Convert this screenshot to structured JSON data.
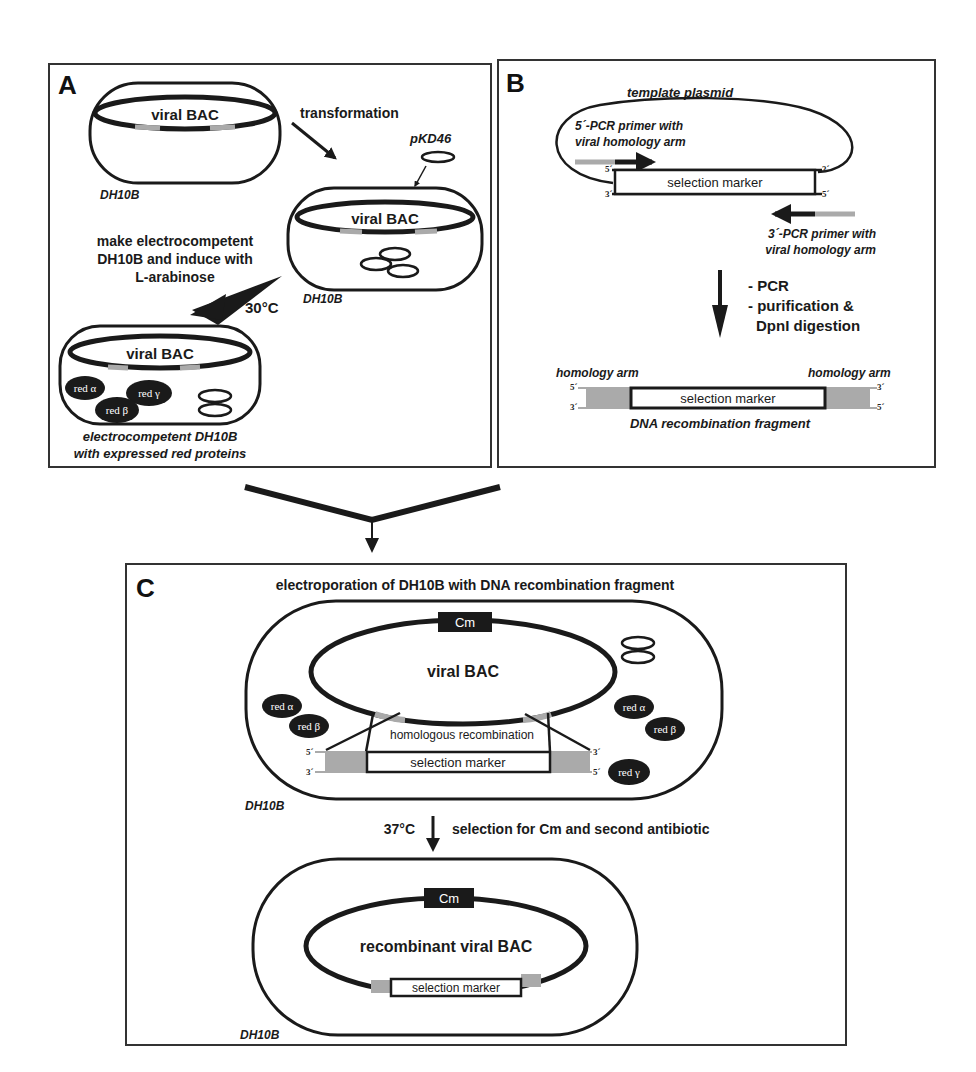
{
  "colors": {
    "ink": "#1a1a1a",
    "homology_gray": "#a8a8a8",
    "background": "#ffffff"
  },
  "panel_a": {
    "letter": "A",
    "cell1": {
      "plasmid_label": "viral BAC",
      "cell_label": "DH10B"
    },
    "step1_label": "transformation",
    "helper_plasmid": "pKD46",
    "cell2": {
      "plasmid_label": "viral BAC",
      "cell_label": "DH10B"
    },
    "step2_label_lines": [
      "make electrocompetent",
      "DH10B and induce with",
      "L-arabinose"
    ],
    "temperature": "30°C",
    "cell3": {
      "plasmid_label": "viral BAC",
      "proteins": [
        "red α",
        "red γ",
        "red β"
      ],
      "caption_lines": [
        "electrocompetent DH10B",
        "with expressed red proteins"
      ]
    }
  },
  "panel_b": {
    "letter": "B",
    "template_label": "template plasmid",
    "primer5_lines": [
      "5´-PCR primer with",
      "viral homology arm"
    ],
    "primer3_lines": [
      "3´-PCR primer with",
      "viral homology arm"
    ],
    "marker_label": "selection marker",
    "end_labels": {
      "five_prime": "5´",
      "three_prime": "3´"
    },
    "steps": [
      "- PCR",
      "- purification &",
      "  DpnI digestion"
    ],
    "homology_left": "homology arm",
    "homology_right": "homology arm",
    "fragment_label": "DNA recombination fragment"
  },
  "panel_c": {
    "letter": "C",
    "title": "electroporation of DH10B with DNA recombination fragment",
    "cm_label": "Cm",
    "plasmid_label": "viral BAC",
    "recombination_label": "homologous recombination",
    "marker_label": "selection marker",
    "proteins_left": [
      "red α",
      "red β"
    ],
    "proteins_right": [
      "red α",
      "red β",
      "red γ"
    ],
    "cell_label": "DH10B",
    "temperature": "37°C",
    "selection_label": "selection for Cm and second antibiotic",
    "result": {
      "cm_label": "Cm",
      "plasmid_label": "recombinant viral BAC",
      "marker_label": "selection marker",
      "cell_label": "DH10B"
    }
  }
}
